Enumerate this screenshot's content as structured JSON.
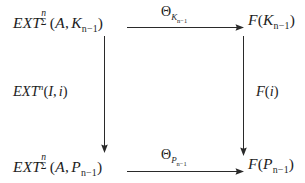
{
  "diagram": {
    "kind": "commutative-square",
    "background_color": "#ffffff",
    "ink_color": "#1d1d1d",
    "nodes": {
      "top_left": {
        "plain": "EXT^n_Σ(A, K_{n-1})",
        "base": "EXT",
        "superscript": "n",
        "subscript": "Σ",
        "args_open": "(",
        "arg1": "A",
        "separator": ",",
        "arg2_base": "K",
        "arg2_sub": "n−1",
        "args_close": ")"
      },
      "top_right": {
        "plain": "F(K_{n-1})",
        "base": "F",
        "args_open": "(",
        "arg_base": "K",
        "arg_sub": "n−1",
        "args_close": ")"
      },
      "bottom_left": {
        "plain": "EXT^n_Σ(A, P_{n-1})",
        "base": "EXT",
        "superscript": "n",
        "subscript": "Σ",
        "args_open": "(",
        "arg1": "A",
        "separator": ",",
        "arg2_base": "P",
        "arg2_sub": "n−1",
        "args_close": ")"
      },
      "bottom_right": {
        "plain": "F(P_{n-1})",
        "base": "F",
        "args_open": "(",
        "arg_base": "P",
        "arg_sub": "n−1",
        "args_close": ")"
      }
    },
    "arrows": {
      "top": {
        "direction": "right",
        "label_plain": "Θ_{K_{n-1}}",
        "label_base": "Θ",
        "label_sub_base": "K",
        "label_sub_sub": "n−1"
      },
      "bottom": {
        "direction": "right",
        "label_plain": "Θ_{P_{n-1}}",
        "label_base": "Θ",
        "label_sub_base": "P",
        "label_sub_sub": "n−1"
      },
      "left": {
        "direction": "down",
        "label_plain": "EXT^n(I, i)",
        "label_base": "EXT",
        "label_superscript": "n",
        "args_open": "(",
        "arg1": "I",
        "separator": ",",
        "arg2": "i",
        "args_close": ")"
      },
      "right": {
        "direction": "down",
        "label_plain": "F(i)",
        "label_base": "F",
        "args_open": "(",
        "arg1": "i",
        "args_close": ")"
      }
    }
  }
}
